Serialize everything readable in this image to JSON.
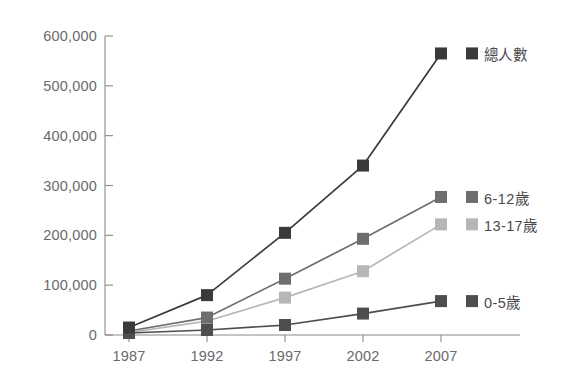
{
  "chart_data": {
    "type": "line",
    "title": "",
    "subtitle": "",
    "xlabel": "",
    "ylabel": "",
    "categories": [
      "1987",
      "1992",
      "1997",
      "2002",
      "2007"
    ],
    "x": [
      1987,
      1992,
      1997,
      2002,
      2007
    ],
    "xlim": [
      1987,
      2007
    ],
    "ylim": [
      0,
      600000
    ],
    "ytick_labels": [
      "0",
      "100,000",
      "200,000",
      "300,000",
      "400,000",
      "500,000",
      "600,000"
    ],
    "ytick_values": [
      0,
      100000,
      200000,
      300000,
      400000,
      500000,
      600000
    ],
    "grid": false,
    "legend_position": "inline-right",
    "marker": "square",
    "series": [
      {
        "name": "總人數",
        "values": [
          15000,
          80000,
          205000,
          340000,
          565000
        ],
        "color": "#3a3a3c",
        "label_value": 565000
      },
      {
        "name": "6-12歲",
        "values": [
          8000,
          35000,
          113000,
          193000,
          277000
        ],
        "color": "#6e6e70",
        "label_value": 277000
      },
      {
        "name": "13-17歲",
        "values": [
          5000,
          28000,
          75000,
          128000,
          222000
        ],
        "color": "#b6b6b8",
        "label_value": 222000
      },
      {
        "name": "0-5歲",
        "values": [
          4000,
          10000,
          20000,
          43000,
          68000
        ],
        "color": "#4e4e50",
        "label_value": 68000
      }
    ]
  },
  "axes": {
    "axis_color": "#8a8a8c",
    "tick_color": "#8a8a8c"
  }
}
